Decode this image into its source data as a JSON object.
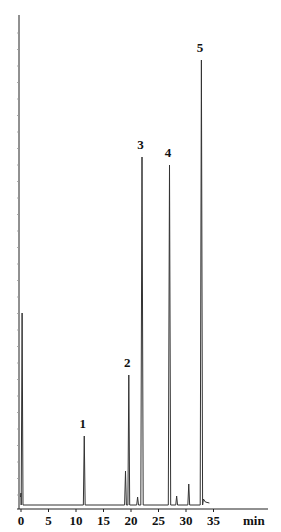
{
  "chart_data": {
    "type": "line",
    "title": "",
    "xlabel": "min",
    "ylabel": "",
    "xlim": [
      0,
      37
    ],
    "xticks": [
      0,
      5,
      10,
      15,
      20,
      25,
      30,
      35
    ],
    "xtick_labels": [
      "0",
      "5",
      "10",
      "15",
      "20",
      "25",
      "30",
      "35"
    ],
    "y_axis_labels_visible": false,
    "grid": false,
    "legend": null,
    "baseline": 0,
    "y_units": "relative detector response (arbitrary)",
    "peaks": [
      {
        "label": "",
        "rt": 0.2,
        "height": 192,
        "note": "solvent front"
      },
      {
        "label": "1",
        "rt": 11.5,
        "height": 69
      },
      {
        "label": "",
        "rt": 19.0,
        "height": 34
      },
      {
        "label": "2",
        "rt": 19.6,
        "height": 130
      },
      {
        "label": "",
        "rt": 21.2,
        "height": 8
      },
      {
        "label": "3",
        "rt": 22.0,
        "height": 348
      },
      {
        "label": "4",
        "rt": 27.0,
        "height": 340
      },
      {
        "label": "",
        "rt": 28.3,
        "height": 9
      },
      {
        "label": "",
        "rt": 30.5,
        "height": 21
      },
      {
        "label": "5",
        "rt": 32.8,
        "height": 445
      }
    ],
    "peak_annotations": [
      "1",
      "2",
      "3",
      "4",
      "5"
    ]
  },
  "axis": {
    "x_unit": "min",
    "tick_labels": [
      "0",
      "5",
      "10",
      "15",
      "20",
      "25",
      "30",
      "35"
    ]
  },
  "colors": {
    "trace": "#333333",
    "axis": "#222222",
    "background": "#ffffff"
  }
}
